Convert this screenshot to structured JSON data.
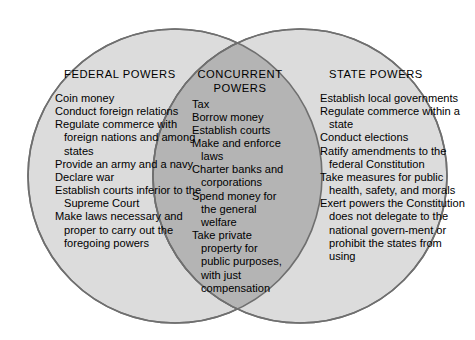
{
  "diagram": {
    "type": "venn-2-set",
    "colors": {
      "outer_fill": "#dcdcdc",
      "overlap_fill": "#b4b4b4",
      "stroke": "#6f6f6f",
      "text": "#000000",
      "background": "#ffffff"
    },
    "left_set": {
      "heading": "FEDERAL POWERS",
      "items": [
        "Coin money",
        "Conduct foreign relations",
        "Regulate commerce with foreign nations and among states",
        "Provide an army and a navy",
        "Declare war",
        "Establish courts inferior to the Supreme Court",
        "Make laws necessary and proper to carry out the foregoing powers"
      ]
    },
    "overlap_set": {
      "heading_line1": "CONCURRENT",
      "heading_line2": "POWERS",
      "items": [
        "Tax",
        "Borrow money",
        "Establish courts",
        "Make and enforce laws",
        "Charter banks and corporations",
        "Spend money for the general welfare",
        "Take private property for public purposes, with just compensation"
      ]
    },
    "right_set": {
      "heading": "STATE POWERS",
      "items": [
        "Establish local governments",
        "Regulate commerce within a state",
        "Conduct elections",
        "Ratify amendments to the federal Constitution",
        "Take measures for public health, safety, and morals",
        "Exert powers the Constitution does not delegate to the national govern-ment or prohibit the states from using"
      ]
    }
  }
}
